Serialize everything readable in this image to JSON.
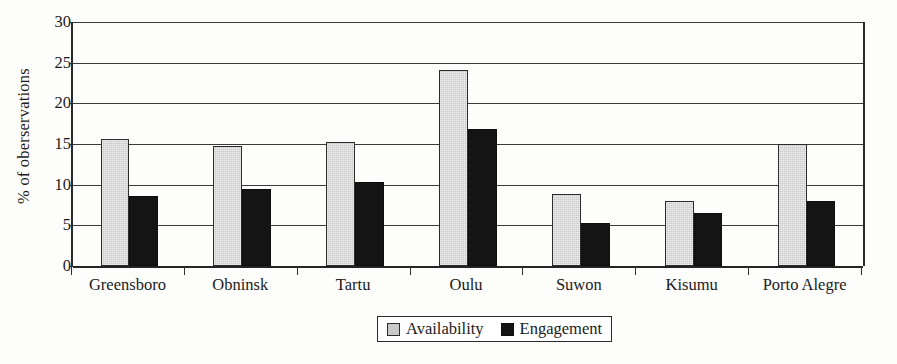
{
  "chart_data": {
    "type": "bar",
    "title": "",
    "xlabel": "",
    "ylabel": "% of oberservations",
    "categories": [
      "Greensboro",
      "Obninsk",
      "Tartu",
      "Oulu",
      "Suwon",
      "Kisumu",
      "Porto Alegre"
    ],
    "series": [
      {
        "name": "Availability",
        "color": "#c9c9c9",
        "values": [
          15.6,
          14.7,
          15.3,
          24.1,
          8.9,
          8.0,
          15.0
        ]
      },
      {
        "name": "Engagement",
        "color": "#141414",
        "values": [
          8.6,
          9.5,
          10.3,
          16.8,
          5.3,
          6.5,
          8.0
        ]
      }
    ],
    "ylim": [
      0,
      30
    ],
    "ytick_values": [
      0,
      5,
      10,
      15,
      20,
      25,
      30
    ],
    "ytick_labels": [
      "0",
      "5",
      "10",
      "15",
      "20",
      "25",
      "30"
    ],
    "grid": true,
    "grid_axis": "y",
    "legend_position": "bottom-center"
  },
  "legend": {
    "entries": [
      {
        "label": "Availability",
        "swatch": "availability-swatch"
      },
      {
        "label": "Engagement",
        "swatch": "engagement-swatch"
      }
    ]
  }
}
